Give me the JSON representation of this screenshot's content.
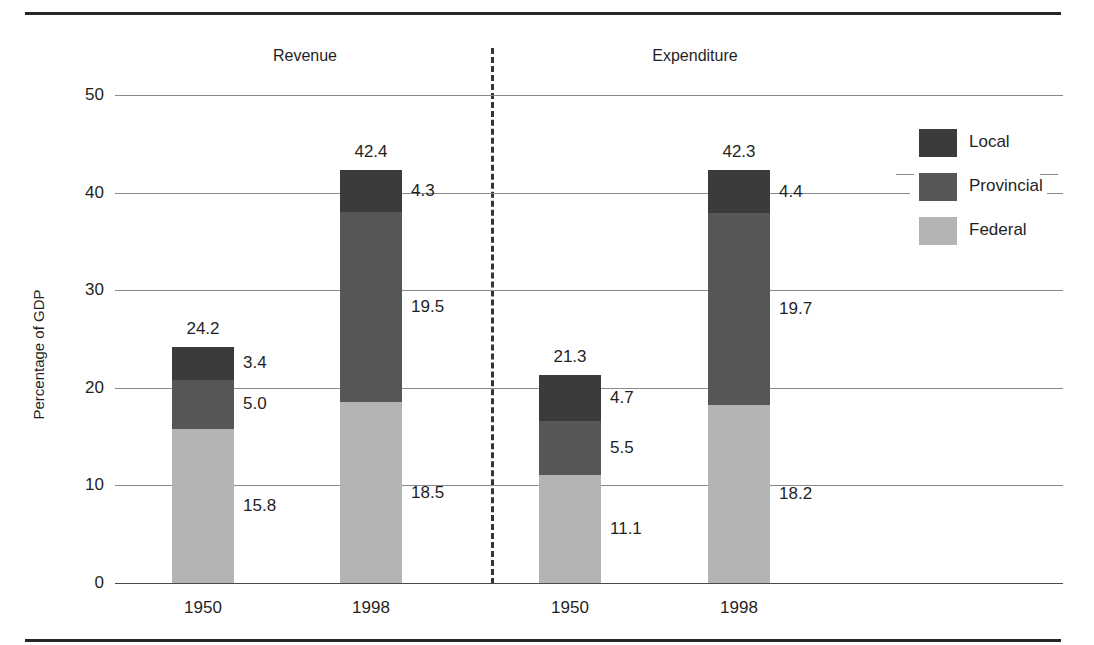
{
  "chart_data": {
    "type": "bar",
    "subtype": "stacked-bar",
    "title": "",
    "xlabel": "",
    "ylabel": "Percentage of GDP",
    "ylim": [
      0,
      50
    ],
    "yticks": [
      "0",
      "10",
      "20",
      "30",
      "40",
      "50"
    ],
    "grid": true,
    "legend_position": "right",
    "panels": [
      {
        "name": "Revenue"
      },
      {
        "name": "Expenditure"
      }
    ],
    "categories": [
      "1950",
      "1998",
      "1950",
      "1998"
    ],
    "group_labels": [
      "Revenue",
      "Revenue",
      "Expenditure",
      "Expenditure"
    ],
    "series": [
      {
        "name": "Federal",
        "color": "#b4b4b4",
        "values": [
          15.8,
          18.5,
          11.1,
          18.2
        ]
      },
      {
        "name": "Provincial",
        "color": "#565656",
        "values": [
          5.0,
          19.5,
          5.5,
          19.7
        ]
      },
      {
        "name": "Local",
        "color": "#3b3b3b",
        "values": [
          3.4,
          4.3,
          4.7,
          4.4
        ]
      }
    ],
    "totals": [
      "24.2",
      "42.4",
      "21.3",
      "42.3"
    ],
    "bars": [
      {
        "group": "Revenue",
        "category": "1950",
        "total": "24.2",
        "segments": [
          {
            "series": "Local",
            "value": 3.4,
            "label": "3.4"
          },
          {
            "series": "Provincial",
            "value": 5.0,
            "label": "5.0"
          },
          {
            "series": "Federal",
            "value": 15.8,
            "label": "15.8"
          }
        ]
      },
      {
        "group": "Revenue",
        "category": "1998",
        "total": "42.4",
        "segments": [
          {
            "series": "Local",
            "value": 4.3,
            "label": "4.3"
          },
          {
            "series": "Provincial",
            "value": 19.5,
            "label": "19.5"
          },
          {
            "series": "Federal",
            "value": 18.5,
            "label": "18.5"
          }
        ]
      },
      {
        "group": "Expenditure",
        "category": "1950",
        "total": "21.3",
        "segments": [
          {
            "series": "Local",
            "value": 4.7,
            "label": "4.7"
          },
          {
            "series": "Provincial",
            "value": 5.5,
            "label": "5.5"
          },
          {
            "series": "Federal",
            "value": 11.1,
            "label": "11.1"
          }
        ]
      },
      {
        "group": "Expenditure",
        "category": "1998",
        "total": "42.3",
        "segments": [
          {
            "series": "Local",
            "value": 4.4,
            "label": "4.4"
          },
          {
            "series": "Provincial",
            "value": 19.7,
            "label": "19.7"
          },
          {
            "series": "Federal",
            "value": 18.2,
            "label": "18.2"
          }
        ]
      }
    ]
  },
  "axis": {
    "y_title": "Percentage of GDP",
    "y_ticks": [
      "50",
      "40",
      "30",
      "20",
      "10",
      "0"
    ],
    "x_ticks": [
      "1950",
      "1998",
      "1950",
      "1998"
    ]
  },
  "panels": {
    "left_title": "Revenue",
    "right_title": "Expenditure"
  },
  "legend": {
    "items": [
      {
        "label": "Local",
        "color": "#3b3b3b"
      },
      {
        "label": "Provincial",
        "color": "#565656"
      },
      {
        "label": "Federal",
        "color": "#b4b4b4"
      }
    ]
  },
  "totals": {
    "rev_1950": "24.2",
    "rev_1998": "42.4",
    "exp_1950": "21.3",
    "exp_1998": "42.3"
  },
  "values": {
    "rev_1950_local": "3.4",
    "rev_1950_prov": "5.0",
    "rev_1950_fed": "15.8",
    "rev_1998_local": "4.3",
    "rev_1998_prov": "19.5",
    "rev_1998_fed": "18.5",
    "exp_1950_local": "4.7",
    "exp_1950_prov": "5.5",
    "exp_1950_fed": "11.1",
    "exp_1998_local": "4.4",
    "exp_1998_prov": "19.7",
    "exp_1998_fed": "18.2"
  },
  "colors": {
    "local": "#3b3b3b",
    "provincial": "#565656",
    "federal": "#b4b4b4",
    "grid": "#8a8a8a",
    "rule": "#262626"
  }
}
